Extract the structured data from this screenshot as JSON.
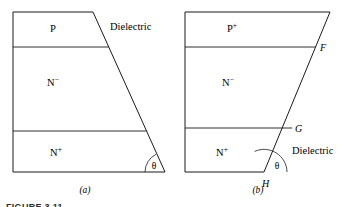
{
  "figure": {
    "caption": "FIGURE 3.11",
    "panels": [
      {
        "id": "a",
        "panel_label": "(a)",
        "geometry": {
          "top_left": [
            13,
            12
          ],
          "top_right": [
            93,
            12
          ],
          "bottom_right": [
            165,
            172
          ],
          "bottom_left": [
            13,
            172
          ],
          "dividers_y": [
            47,
            131
          ],
          "angle_vertex": [
            165,
            172
          ]
        },
        "regions": [
          {
            "name": "P",
            "base": "P",
            "superscript": "",
            "x": 53,
            "y": 32
          },
          {
            "name": "N-minus",
            "base": "N",
            "superscript": "−",
            "x": 53,
            "y": 86
          },
          {
            "name": "N-plus",
            "base": "N",
            "superscript": "+",
            "x": 56,
            "y": 156
          }
        ],
        "annotations": [
          {
            "name": "dielectric-label",
            "text": "Dielectric",
            "x": 110,
            "y": 30
          },
          {
            "name": "theta-label",
            "text": "θ",
            "x": 154,
            "y": 168
          }
        ]
      },
      {
        "id": "b",
        "panel_label": "(b)",
        "geometry": {
          "top_left": [
            185,
            12
          ],
          "top_right": [
            330,
            12
          ],
          "bottom_right": [
            264,
            172
          ],
          "bottom_left": [
            185,
            172
          ],
          "dividers_y": [
            47,
            128
          ],
          "angle_vertex": [
            264,
            172
          ]
        },
        "regions": [
          {
            "name": "P-plus",
            "base": "P",
            "superscript": "+",
            "x": 232,
            "y": 32
          },
          {
            "name": "N-minus",
            "base": "N",
            "superscript": "−",
            "x": 228,
            "y": 86
          },
          {
            "name": "N-plus",
            "base": "N",
            "superscript": "+",
            "x": 222,
            "y": 156
          }
        ],
        "annotations": [
          {
            "name": "point-f-label",
            "text": "F",
            "x": 320,
            "y": 51
          },
          {
            "name": "point-g-label",
            "text": "G",
            "x": 294,
            "y": 131
          },
          {
            "name": "point-h-label",
            "text": "H",
            "x": 265,
            "y": 186
          },
          {
            "name": "dielectric-label",
            "text": "Dielectric",
            "x": 292,
            "y": 154
          },
          {
            "name": "theta-label",
            "text": "θ",
            "x": 277,
            "y": 168
          }
        ]
      }
    ],
    "panel_label_positions": [
      {
        "x": 85,
        "y": 193
      },
      {
        "x": 258,
        "y": 193
      }
    ],
    "colors": {
      "line": "#1a1a1a",
      "text": "#000000",
      "background": "#ffffff",
      "caption": "#2b2b2b"
    }
  }
}
